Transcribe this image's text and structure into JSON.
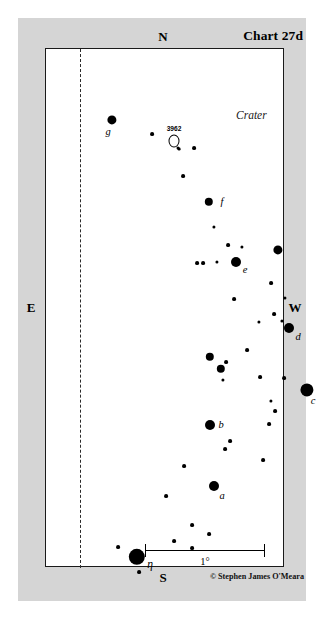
{
  "chart": {
    "title": "Chart 27d",
    "constellation": "Crater",
    "credit": "© Stephen James O'Meara",
    "cardinals": {
      "north": "N",
      "south": "S",
      "east": "E",
      "west": "W"
    },
    "scale_bar": {
      "label": "1°"
    },
    "colors": {
      "background": "#d5d5d5",
      "field": "#ffffff",
      "ink": "#000000",
      "frame": "#1a1a1a"
    }
  },
  "deep_sky_objects": [
    {
      "name": "3962",
      "type": "galaxy",
      "x": 128,
      "y": 92
    }
  ],
  "labeled_stars": [
    {
      "label": "g",
      "x": 66,
      "y": 71,
      "r": 4.6,
      "lx": 62,
      "ly": 77
    },
    {
      "label": "f",
      "x": 163,
      "y": 153,
      "r": 4.2,
      "lx": 176,
      "ly": 147
    },
    {
      "label": "e",
      "x": 190,
      "y": 213,
      "r": 5.0,
      "lx": 199,
      "ly": 215
    },
    {
      "label": "d",
      "x": 243,
      "y": 279,
      "r": 5.0,
      "lx": 252,
      "ly": 282
    },
    {
      "label": "c",
      "x": 261,
      "y": 341,
      "r": 6.6,
      "lx": 267,
      "ly": 346
    },
    {
      "label": "b",
      "x": 164,
      "y": 376,
      "r": 5.0,
      "lx": 175,
      "ly": 370
    },
    {
      "label": "a",
      "x": 168,
      "y": 437,
      "r": 5.0,
      "lx": 176,
      "ly": 441
    },
    {
      "label": "η",
      "x": 91,
      "y": 508,
      "r": 8.2,
      "lx": 104,
      "ly": 509
    }
  ],
  "field_stars": [
    {
      "x": 106,
      "y": 85,
      "r": 1.9
    },
    {
      "x": 133,
      "y": 100,
      "r": 1.4
    },
    {
      "x": 148,
      "y": 99,
      "r": 1.9
    },
    {
      "x": 137,
      "y": 127,
      "r": 1.9
    },
    {
      "x": 168,
      "y": 178,
      "r": 1.6
    },
    {
      "x": 182,
      "y": 196,
      "r": 1.9
    },
    {
      "x": 196,
      "y": 198,
      "r": 1.6
    },
    {
      "x": 232,
      "y": 201,
      "r": 4.6
    },
    {
      "x": 151,
      "y": 214,
      "r": 1.9
    },
    {
      "x": 157,
      "y": 214,
      "r": 1.9
    },
    {
      "x": 171,
      "y": 213,
      "r": 1.6
    },
    {
      "x": 225,
      "y": 234,
      "r": 1.9
    },
    {
      "x": 188,
      "y": 250,
      "r": 1.9
    },
    {
      "x": 239,
      "y": 249,
      "r": 1.6
    },
    {
      "x": 228,
      "y": 265,
      "r": 1.9
    },
    {
      "x": 236,
      "y": 272,
      "r": 1.6
    },
    {
      "x": 213,
      "y": 273,
      "r": 1.6
    },
    {
      "x": 201,
      "y": 301,
      "r": 1.9
    },
    {
      "x": 164,
      "y": 308,
      "r": 4.2
    },
    {
      "x": 180,
      "y": 313,
      "r": 1.9
    },
    {
      "x": 175,
      "y": 320,
      "r": 4.2
    },
    {
      "x": 177,
      "y": 331,
      "r": 1.6
    },
    {
      "x": 214,
      "y": 328,
      "r": 1.9
    },
    {
      "x": 238,
      "y": 329,
      "r": 1.9
    },
    {
      "x": 225,
      "y": 352,
      "r": 1.6
    },
    {
      "x": 229,
      "y": 362,
      "r": 1.9
    },
    {
      "x": 223,
      "y": 375,
      "r": 1.9
    },
    {
      "x": 184,
      "y": 392,
      "r": 1.9
    },
    {
      "x": 179,
      "y": 400,
      "r": 1.9
    },
    {
      "x": 217,
      "y": 411,
      "r": 1.9
    },
    {
      "x": 138,
      "y": 417,
      "r": 1.9
    },
    {
      "x": 120,
      "y": 447,
      "r": 1.9
    },
    {
      "x": 146,
      "y": 476,
      "r": 1.9
    },
    {
      "x": 163,
      "y": 485,
      "r": 1.9
    },
    {
      "x": 128,
      "y": 492,
      "r": 1.9
    },
    {
      "x": 146,
      "y": 499,
      "r": 1.9
    },
    {
      "x": 72,
      "y": 498,
      "r": 1.9
    },
    {
      "x": 93,
      "y": 523,
      "r": 1.9
    }
  ]
}
